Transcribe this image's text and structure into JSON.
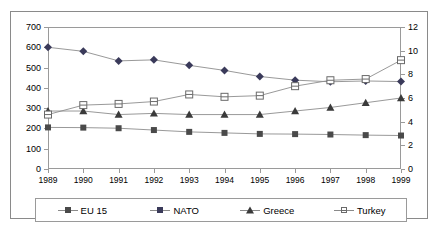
{
  "chart_data": {
    "type": "line",
    "title": "",
    "xlabel": "",
    "ylabel": "",
    "grid": false,
    "legend_position": "bottom",
    "categories": [
      "1989",
      "1990",
      "1991",
      "1992",
      "1993",
      "1994",
      "1995",
      "1996",
      "1997",
      "1998",
      "1999"
    ],
    "axes": {
      "left": {
        "label": "",
        "min": 0,
        "max": 700,
        "step": 100,
        "ticks": [
          "0",
          "100",
          "200",
          "300",
          "400",
          "500",
          "600",
          "700"
        ]
      },
      "right": {
        "label": "",
        "min": 0,
        "max": 12,
        "step": 2,
        "ticks": [
          "0",
          "2",
          "4",
          "6",
          "8",
          "10",
          "12"
        ]
      }
    },
    "series": [
      {
        "name": "EU 15",
        "axis": "left",
        "marker": "filled-square",
        "values": [
          205,
          204,
          201,
          192,
          183,
          178,
          173,
          172,
          170,
          167,
          165
        ]
      },
      {
        "name": "NATO",
        "axis": "left",
        "marker": "filled-diamond",
        "values": [
          600,
          580,
          533,
          538,
          511,
          486,
          456,
          438,
          430,
          434,
          431
        ]
      },
      {
        "name": "Greece",
        "axis": "right",
        "marker": "filled-triangle",
        "values": [
          4.9,
          4.9,
          4.6,
          4.7,
          4.6,
          4.6,
          4.6,
          4.9,
          5.2,
          5.6,
          6.0
        ]
      },
      {
        "name": "Turkey",
        "axis": "right",
        "marker": "open-square",
        "values": [
          4.6,
          5.4,
          5.5,
          5.7,
          6.3,
          6.1,
          6.2,
          7.0,
          7.5,
          7.6,
          9.2
        ]
      }
    ]
  },
  "legend": {
    "items": [
      {
        "label": "EU 15",
        "marker": "filled-square"
      },
      {
        "label": "NATO",
        "marker": "filled-diamond"
      },
      {
        "label": "Greece",
        "marker": "filled-triangle"
      },
      {
        "label": "Turkey",
        "marker": "open-square"
      }
    ]
  },
  "colors": {
    "eu15": "#4a4a4a",
    "nato": "#3a3a5a",
    "greece": "#3a3a3a",
    "turkey": "#6a6a6a",
    "axis": "#9a9a9a",
    "border": "#8a8a8a"
  }
}
